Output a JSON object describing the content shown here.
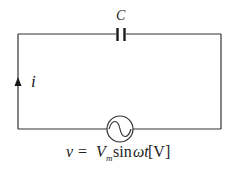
{
  "diagram": {
    "type": "circuit",
    "components": [
      {
        "id": "capacitor",
        "symbol": "capacitor",
        "label": "C",
        "position": "top"
      },
      {
        "id": "source",
        "symbol": "ac-voltage-source",
        "position": "bottom"
      }
    ],
    "current": {
      "label": "i",
      "direction": "up",
      "position": "left-wire"
    },
    "source_equation": {
      "v": "v",
      "equals": "=",
      "V": "V",
      "sub": "m",
      "func": "sin",
      "omega_t": "ωt",
      "unit": "[V]"
    },
    "colors": {
      "wire": "#333333",
      "text": "#222222",
      "background": "#ffffff"
    }
  }
}
